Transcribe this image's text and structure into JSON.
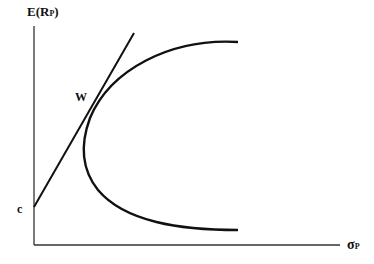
{
  "diagram": {
    "y_axis_label": "E(R",
    "y_axis_sub": "P",
    "y_axis_close": ")",
    "x_axis_label": "σ",
    "x_axis_sub": "P",
    "tangent_point_label": "W",
    "intercept_label": "c",
    "colors": {
      "line": "#111111",
      "axis": "#333333",
      "background": "#ffffff"
    }
  }
}
